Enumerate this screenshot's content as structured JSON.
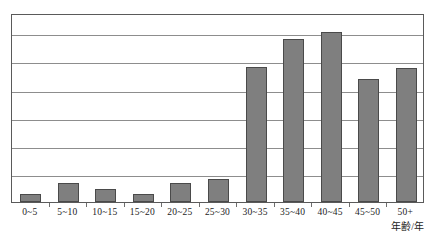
{
  "chart_data": {
    "type": "bar",
    "title": "",
    "subtitle": "",
    "xlabel": "年齢/年",
    "ylabel": "",
    "categories": [
      "0~5",
      "5~10",
      "10~15",
      "15~20",
      "20~25",
      "25~30",
      "30~35",
      "35~40",
      "40~45",
      "45~50",
      "50+"
    ],
    "values": [
      0.28,
      0.68,
      0.46,
      0.28,
      0.68,
      0.82,
      4.8,
      5.8,
      6.05,
      4.38,
      4.77
    ],
    "ylim": [
      0,
      6.72
    ],
    "gridlines": [
      1,
      2,
      3,
      4,
      5,
      6
    ],
    "grid": true,
    "legend": null,
    "legend_position": "none",
    "annotations": [],
    "bar_color": "#7f7f7f",
    "bar_outline_color": "#4a4a4a",
    "grid_color": "#8d8d8d",
    "frame_color": "#5a5a5a",
    "text_color": "#1c1c1c",
    "background": "#ffffff"
  }
}
